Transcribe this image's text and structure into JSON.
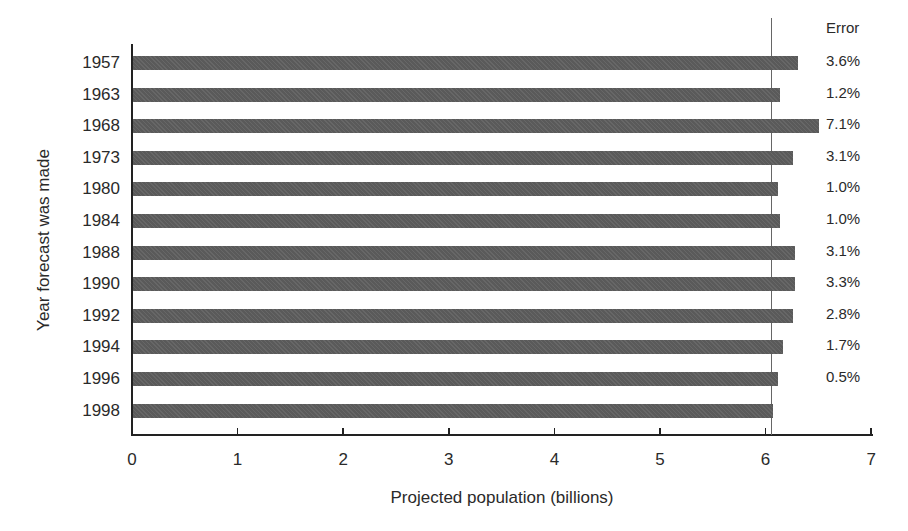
{
  "chart_data": {
    "type": "bar",
    "orientation": "horizontal",
    "title": "",
    "xlabel": "Projected population (billions)",
    "ylabel": "Year forecast was made",
    "xlim": [
      0,
      7
    ],
    "xticks": [
      "0",
      "1",
      "2",
      "3",
      "4",
      "5",
      "6",
      "7"
    ],
    "grid": false,
    "reference_line": {
      "x": 6.05,
      "style": "thin vertical line"
    },
    "categories": [
      "1957",
      "1963",
      "1968",
      "1973",
      "1980",
      "1984",
      "1988",
      "1990",
      "1992",
      "1994",
      "1996",
      "1998"
    ],
    "values": [
      6.3,
      6.13,
      6.5,
      6.25,
      6.11,
      6.13,
      6.27,
      6.27,
      6.25,
      6.16,
      6.11,
      6.06
    ],
    "annotation_column_title": "Error",
    "errors": [
      "3.6%",
      "1.2%",
      "7.1%",
      "3.1%",
      "1.0%",
      "1.0%",
      "3.1%",
      "3.3%",
      "2.8%",
      "1.7%",
      "0.5%",
      ""
    ],
    "bar_color": "#5a5a5a"
  }
}
